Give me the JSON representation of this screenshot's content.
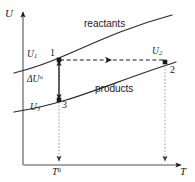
{
  "figure": {
    "type": "thermodynamic-energy-temperature-diagram",
    "axes": {
      "y_label": "U",
      "x_label": "T",
      "y_axis_name": "internal-energy-axis",
      "x_axis_name": "temperature-axis"
    },
    "curves": [
      {
        "name": "reactants-curve",
        "label": "reactants"
      },
      {
        "name": "products-curve",
        "label": "products"
      }
    ],
    "points": [
      {
        "name": "point-1",
        "number": "1",
        "energy_label": "U",
        "energy_sub": "1"
      },
      {
        "name": "point-2",
        "number": "2",
        "energy_label": "U",
        "energy_sub": "2"
      },
      {
        "name": "point-3",
        "number": "3",
        "energy_label": "U",
        "energy_sub": "3"
      }
    ],
    "annotations": {
      "delta_u": "ΔU",
      "delta_u_sup": "o",
      "t_standard": "T",
      "t_standard_sup": "0"
    },
    "colors": {
      "ink": "#1a1a1a",
      "curve": "#262626",
      "dotted": "#8c8c8c",
      "background": "#ffffff"
    }
  }
}
